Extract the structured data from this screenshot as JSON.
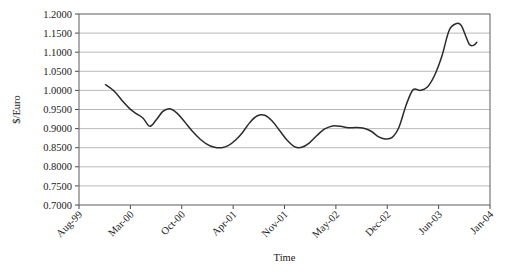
{
  "chart_data": {
    "type": "line",
    "title": "",
    "xlabel": "Time",
    "ylabel": "$/Euro",
    "ylim": [
      0.7,
      1.2
    ],
    "ytick_step": 0.05,
    "ytick_labels": [
      "0.7000",
      "0.7500",
      "0.8000",
      "0.8500",
      "0.9000",
      "0.9500",
      "1.0000",
      "1.0500",
      "1.1000",
      "1.1500",
      "1.2000"
    ],
    "ytick_values": [
      0.7,
      0.75,
      0.8,
      0.85,
      0.9,
      0.95,
      1.0,
      1.05,
      1.1,
      1.15,
      1.2
    ],
    "xtick_labels": [
      "Aug-99",
      "Mar-00",
      "Oct-00",
      "Apr-01",
      "Nov-01",
      "May-02",
      "Dec-02",
      "Jun-03",
      "Jan-04"
    ],
    "xtick_rotation_deg": 45,
    "grid": "horizontal",
    "legend": "none",
    "series": [
      {
        "name": "$/Euro exchange rate",
        "color": "#2b2b2b",
        "x": [
          0.0645,
          0.0875,
          0.1075,
          0.1245,
          0.1395,
          0.156,
          0.172,
          0.188,
          0.204,
          0.221,
          0.239,
          0.257,
          0.276,
          0.295,
          0.313,
          0.33,
          0.347,
          0.364,
          0.381,
          0.398,
          0.415,
          0.433,
          0.452,
          0.47,
          0.488,
          0.506,
          0.524,
          0.542,
          0.56,
          0.579,
          0.598,
          0.617,
          0.636,
          0.655,
          0.674,
          0.693,
          0.711,
          0.728,
          0.745,
          0.762,
          0.779,
          0.796,
          0.813,
          0.83,
          0.847,
          0.865,
          0.883,
          0.901,
          0.919,
          0.93
        ],
        "y": [
          1.015,
          0.996,
          0.97,
          0.951,
          0.939,
          0.927,
          0.906,
          0.923,
          0.945,
          0.952,
          0.94,
          0.918,
          0.893,
          0.872,
          0.858,
          0.851,
          0.85,
          0.856,
          0.87,
          0.89,
          0.915,
          0.933,
          0.935,
          0.92,
          0.895,
          0.87,
          0.853,
          0.851,
          0.862,
          0.882,
          0.899,
          0.907,
          0.906,
          0.902,
          0.903,
          0.901,
          0.893,
          0.879,
          0.873,
          0.877,
          0.905,
          0.962,
          1.002,
          1.0,
          1.008,
          1.039,
          1.09,
          1.158,
          1.175,
          1.17
        ]
      }
    ],
    "series_tail": {
      "x": [
        0.93,
        0.94,
        0.95,
        0.96,
        0.968
      ],
      "y": [
        1.17,
        1.145,
        1.12,
        1.118,
        1.126
      ]
    }
  },
  "axes": {
    "y_axis_title": "$/Euro",
    "x_axis_title": "Time"
  },
  "caption": {
    "text": ""
  }
}
